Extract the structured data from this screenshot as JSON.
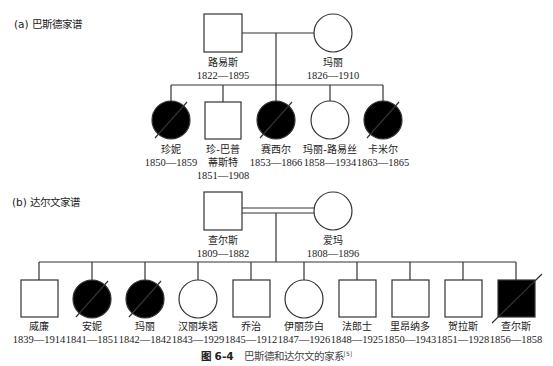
{
  "pedigree_a": {
    "title": "(a) 巴斯德家谱",
    "parents": [
      {
        "name": "路易斯",
        "years": "1822—1895",
        "sex": "male",
        "affected": false,
        "deceased": false
      },
      {
        "name": "玛丽",
        "years": "1826—1910",
        "sex": "female",
        "affected": false,
        "deceased": false
      }
    ],
    "children": [
      {
        "name": "珍妮",
        "years": "1850—1859",
        "sex": "female",
        "affected": true,
        "deceased": true
      },
      {
        "name": "珍-巴普",
        "name2": "蒂斯特",
        "years": "1851—1908",
        "sex": "male",
        "affected": false,
        "deceased": false
      },
      {
        "name": "赛西尔",
        "years": "1853—1866",
        "sex": "female",
        "affected": true,
        "deceased": true
      },
      {
        "name": "玛丽-路易丝",
        "years": "1858—1934",
        "sex": "female",
        "affected": false,
        "deceased": false
      },
      {
        "name": "卡米尔",
        "years": "1863—1865",
        "sex": "female",
        "affected": true,
        "deceased": true
      }
    ]
  },
  "pedigree_b": {
    "title": "(b) 达尔文家谱",
    "marriage": "consanguineous",
    "parents": [
      {
        "name": "查尔斯",
        "years": "1809—1882",
        "sex": "male",
        "affected": false,
        "deceased": false
      },
      {
        "name": "爱玛",
        "years": "1808—1896",
        "sex": "female",
        "affected": false,
        "deceased": false
      }
    ],
    "children": [
      {
        "name": "威廉",
        "years": "1839—1914",
        "sex": "male",
        "affected": false,
        "deceased": false
      },
      {
        "name": "安妮",
        "years": "1841—1851",
        "sex": "female",
        "affected": true,
        "deceased": true
      },
      {
        "name": "玛丽",
        "years": "1842—1842",
        "sex": "female",
        "affected": true,
        "deceased": true
      },
      {
        "name": "汉丽埃塔",
        "years": "1843—1929",
        "sex": "female",
        "affected": false,
        "deceased": false
      },
      {
        "name": "乔治",
        "years": "1845—1912",
        "sex": "male",
        "affected": false,
        "deceased": false
      },
      {
        "name": "伊丽莎白",
        "years": "1847—1926",
        "sex": "female",
        "affected": false,
        "deceased": false
      },
      {
        "name": "法郎士",
        "years": "1848—1925",
        "sex": "male",
        "affected": false,
        "deceased": false
      },
      {
        "name": "里昂纳多",
        "years": "1850—1943",
        "sex": "male",
        "affected": false,
        "deceased": false
      },
      {
        "name": "贺拉斯",
        "years": "1851—1928",
        "sex": "male",
        "affected": false,
        "deceased": false
      },
      {
        "name": "查尔斯",
        "years": "1856—1858",
        "sex": "male",
        "affected": true,
        "deceased": true
      }
    ]
  },
  "caption": {
    "figure": "图 6-4",
    "text": "巴斯德和达尔文的家系",
    "ref": "[5]"
  },
  "colors": {
    "line": "#333333",
    "fill_affected": "#000000",
    "fill_unaffected": "#ffffff"
  }
}
